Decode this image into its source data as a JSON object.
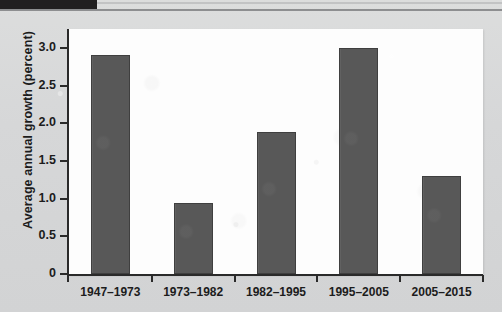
{
  "figure": {
    "header_band_name": "chapter-marker-band"
  },
  "chart_data": {
    "type": "bar",
    "title": "",
    "subtitle": "",
    "xlabel": "",
    "ylabel": "Average annual growth (percent)",
    "categories": [
      "1947–1973",
      "1973–1982",
      "1982–1995",
      "1995–2005",
      "2005–2015"
    ],
    "values": [
      2.9,
      0.94,
      1.88,
      3.0,
      1.3
    ],
    "ylim": [
      0,
      3.25
    ],
    "yticks": [
      0,
      0.5,
      1.0,
      1.5,
      2.0,
      2.5,
      3.0
    ],
    "ytick_labels": [
      "0",
      "0.5",
      "1.0",
      "1.5",
      "2.0",
      "2.5",
      "3.0"
    ],
    "grid": false,
    "legend": null,
    "bar_color": "#585858",
    "plot_background": "#fdfdfd",
    "page_background": "#d9dadb",
    "axis_color": "#2a2a2a"
  }
}
